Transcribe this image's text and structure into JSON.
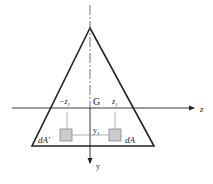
{
  "diagram": {
    "labels": {
      "centroid": "G",
      "z_axis": "z",
      "y_axis": "y",
      "neg_z1": "−z",
      "neg_z1_sub": "1",
      "pos_z1": "z",
      "pos_z1_sub": "1",
      "y1": "y",
      "y1_sub": "1",
      "dA_left": "dA'",
      "dA_right": "dA"
    },
    "colors": {
      "stroke": "#222222",
      "element_fill": "#cccccc",
      "guide": "#999999"
    }
  }
}
